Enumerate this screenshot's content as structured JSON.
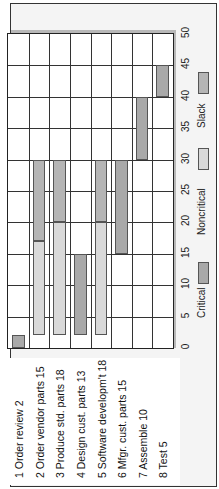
{
  "chart_data": {
    "type": "bar",
    "subtype": "gantt",
    "orientation": "rotated-90",
    "title": "",
    "xlabel": "",
    "ylabel": "",
    "xlim": [
      0,
      50
    ],
    "x_ticks": [
      "0",
      "5",
      "10",
      "15",
      "20",
      "25",
      "30",
      "35",
      "40",
      "45",
      "50"
    ],
    "grid": true,
    "legend": [
      "Critical",
      "Noncritical",
      "Slack"
    ],
    "tasks": [
      {
        "label": "1 Order review 2",
        "segments": [
          {
            "type": "critical",
            "start": 0,
            "end": 2
          }
        ]
      },
      {
        "label": "2 Order vendor parts 15",
        "segments": [
          {
            "type": "noncritical",
            "start": 2,
            "end": 17
          },
          {
            "type": "slack",
            "start": 17,
            "end": 30
          }
        ]
      },
      {
        "label": "3 Produce std. parts 18",
        "segments": [
          {
            "type": "noncritical",
            "start": 2,
            "end": 20
          },
          {
            "type": "slack",
            "start": 20,
            "end": 30
          }
        ]
      },
      {
        "label": "4 Design cust. parts 13",
        "segments": [
          {
            "type": "critical",
            "start": 2,
            "end": 15
          }
        ]
      },
      {
        "label": "5 Software developm't 18",
        "segments": [
          {
            "type": "noncritical",
            "start": 2,
            "end": 20
          },
          {
            "type": "slack",
            "start": 20,
            "end": 30
          }
        ]
      },
      {
        "label": "6 Mfgr. cust. parts 15",
        "segments": [
          {
            "type": "critical",
            "start": 15,
            "end": 30
          }
        ]
      },
      {
        "label": "7 Assemble 10",
        "segments": [
          {
            "type": "critical",
            "start": 30,
            "end": 40
          }
        ]
      },
      {
        "label": "8 Test 5",
        "segments": [
          {
            "type": "critical",
            "start": 40,
            "end": 45
          }
        ]
      }
    ]
  },
  "legend": {
    "critical": "Critical",
    "noncritical": "Noncritical",
    "slack": "Slack"
  },
  "ticks": [
    "0",
    "5",
    "10",
    "15",
    "20",
    "25",
    "30",
    "35",
    "40",
    "45",
    "50"
  ],
  "tasks": [
    "1 Order review 2",
    "2 Order vendor parts 15",
    "3 Produce std. parts 18",
    "4 Design cust. parts 13",
    "5 Software developm't 18",
    "6 Mfgr. cust. parts 15",
    "7 Assemble 10",
    "8 Test 5"
  ],
  "colors": {
    "critical": "#a9a9a9",
    "noncritical": "#d9d9d9",
    "slack": "#b5b5b5"
  }
}
